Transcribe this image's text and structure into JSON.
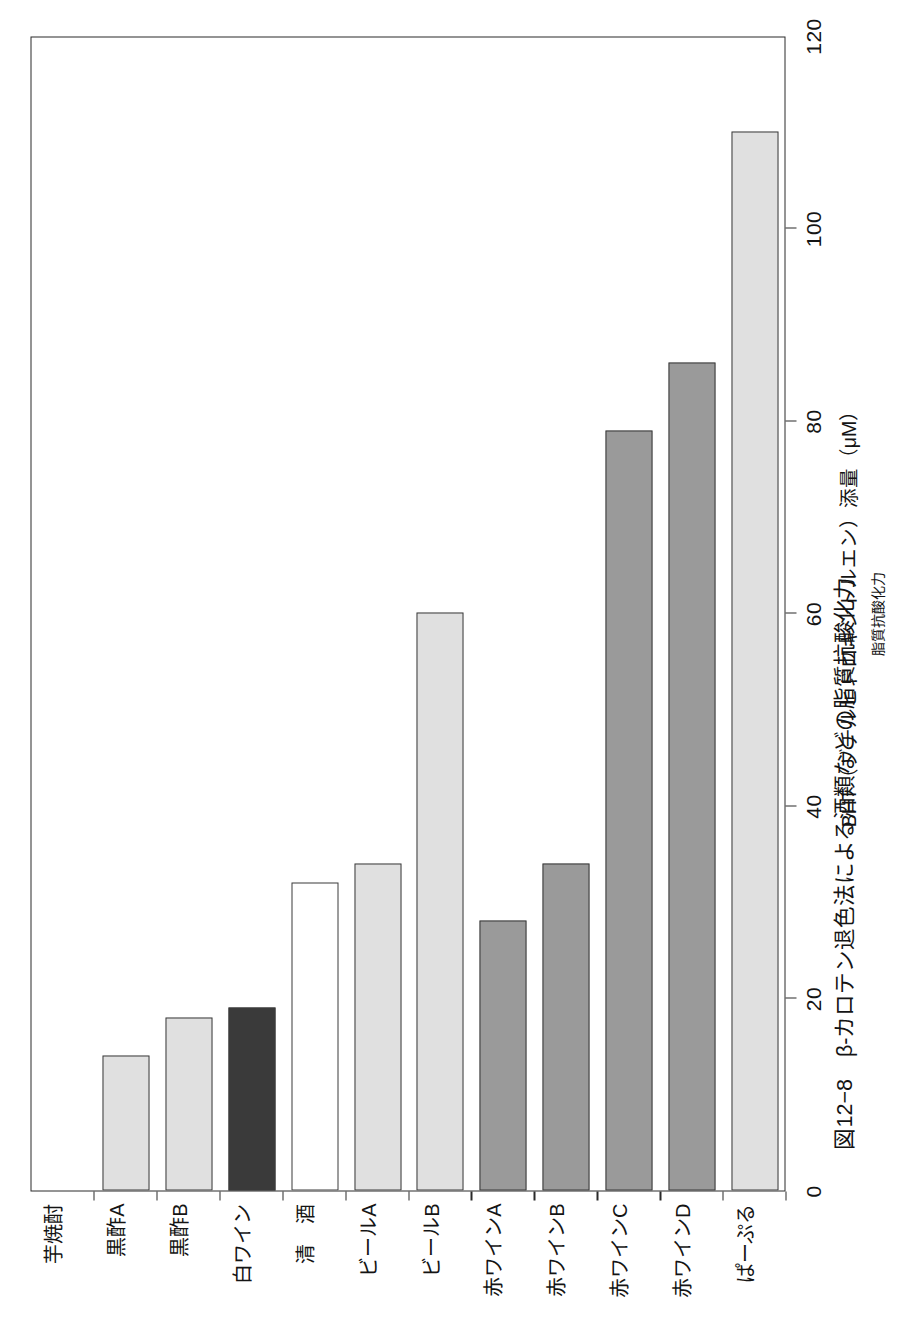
{
  "figure": {
    "caption": "図12−8　β-カロテン退色法による酒類などの脂質抗酸化力",
    "axis_title": "BHT（ブチルヒドロキシトルエン）添量（μM）",
    "axis_subtitle": "脂質抗酸化力"
  },
  "chart_data": {
    "type": "bar",
    "orientation": "horizontal",
    "title": "図12−8　β-カロテン退色法による酒類などの脂質抗酸化力",
    "xlabel": "BHT（ブチルヒドロキシトルエン）添量（μM）",
    "ylabel": "",
    "xlim": [
      0,
      120
    ],
    "xticks": [
      0,
      20,
      40,
      60,
      80,
      100,
      120
    ],
    "xticklabels": [
      "0",
      "20",
      "40",
      "60",
      "80",
      "100",
      "120"
    ],
    "grid": false,
    "legend": "none",
    "categories": [
      "芋焼酎",
      "黒酢A",
      "黒酢B",
      "白ワイン",
      "清　酒",
      "ビールA",
      "ビールB",
      "赤ワインA",
      "赤ワインB",
      "赤ワインC",
      "赤ワインD",
      "ぱーぷる"
    ],
    "values": [
      0,
      14,
      18,
      19,
      32,
      34,
      60,
      28,
      34,
      79,
      86,
      110
    ],
    "bar_colors": [
      "#ffffff",
      "#e0e0e0",
      "#e0e0e0",
      "#3a3a3a",
      "#ffffff",
      "#e0e0e0",
      "#e0e0e0",
      "#9a9a9a",
      "#9a9a9a",
      "#9a9a9a",
      "#9a9a9a",
      "#e0e0e0"
    ],
    "edge_color": "#3a3a3a"
  }
}
